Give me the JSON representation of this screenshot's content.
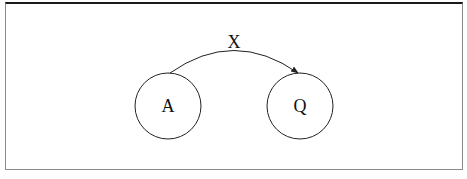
{
  "diagram": {
    "type": "state-transition",
    "nodes": [
      {
        "id": "A",
        "label": "A",
        "cx": 168,
        "cy": 106,
        "r": 33
      },
      {
        "id": "Q",
        "label": "Q",
        "cx": 300,
        "cy": 106,
        "r": 33
      }
    ],
    "edges": [
      {
        "from": "A",
        "to": "Q",
        "label": "X",
        "directed": true
      }
    ]
  },
  "colors": {
    "stroke": "#222222",
    "frame_top": "#1a1a1a",
    "frame_side": "#8a8a8a",
    "background": "#ffffff"
  }
}
